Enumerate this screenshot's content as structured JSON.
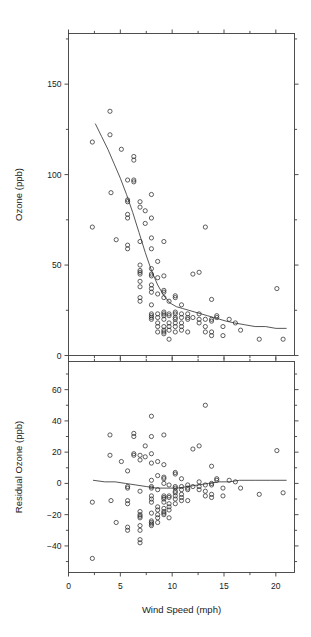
{
  "figure": {
    "background": "#ffffff",
    "point_color": "#2b2b2b",
    "line_color": "#2b2b2b",
    "axis_color": "#3c3c3c"
  },
  "chart_data": [
    {
      "id": "ozone-vs-wind",
      "type": "scatter",
      "title": "",
      "xlabel": "",
      "ylabel": "Ozone (ppb)",
      "xlim": [
        0,
        21.8
      ],
      "ylim": [
        0,
        178
      ],
      "xticks": [
        0,
        5,
        10,
        15,
        20
      ],
      "xticklabels": [
        "0",
        "5",
        "10",
        "15",
        "20"
      ],
      "xminorticks": [
        2.5,
        7.5,
        12.5,
        17.5
      ],
      "yticks": [
        0,
        50,
        100,
        150
      ],
      "yticklabels": [
        "0",
        "50",
        "100",
        "150"
      ],
      "yminorticks": [
        25,
        75,
        125,
        175
      ],
      "grid": false,
      "legend": null,
      "marker": "open-circle",
      "points": [
        [
          2.3,
          118
        ],
        [
          2.3,
          71
        ],
        [
          4.0,
          135
        ],
        [
          4.0,
          122
        ],
        [
          4.1,
          90
        ],
        [
          4.6,
          64
        ],
        [
          5.1,
          114
        ],
        [
          5.7,
          97
        ],
        [
          5.7,
          85
        ],
        [
          5.7,
          86
        ],
        [
          5.7,
          78
        ],
        [
          5.7,
          76
        ],
        [
          5.7,
          59
        ],
        [
          5.7,
          61
        ],
        [
          6.3,
          97
        ],
        [
          6.3,
          108
        ],
        [
          6.3,
          110
        ],
        [
          6.3,
          96
        ],
        [
          6.9,
          85
        ],
        [
          6.9,
          82
        ],
        [
          6.9,
          63
        ],
        [
          6.9,
          50
        ],
        [
          6.9,
          47
        ],
        [
          6.9,
          46
        ],
        [
          6.9,
          45
        ],
        [
          6.9,
          41
        ],
        [
          6.9,
          38
        ],
        [
          6.9,
          32
        ],
        [
          6.9,
          30
        ],
        [
          7.4,
          80
        ],
        [
          7.4,
          73
        ],
        [
          8.0,
          89
        ],
        [
          8.0,
          76
        ],
        [
          8.0,
          65
        ],
        [
          8.0,
          59
        ],
        [
          8.0,
          48
        ],
        [
          8.0,
          44
        ],
        [
          8.0,
          45
        ],
        [
          8.0,
          39
        ],
        [
          8.0,
          37
        ],
        [
          8.0,
          35
        ],
        [
          8.0,
          28
        ],
        [
          8.0,
          23
        ],
        [
          8.0,
          22
        ],
        [
          8.0,
          21
        ],
        [
          8.0,
          20
        ],
        [
          8.6,
          52
        ],
        [
          8.6,
          43
        ],
        [
          8.6,
          34
        ],
        [
          8.6,
          23
        ],
        [
          8.6,
          21
        ],
        [
          8.6,
          18
        ],
        [
          8.6,
          16
        ],
        [
          8.6,
          13
        ],
        [
          9.2,
          63
        ],
        [
          9.2,
          44
        ],
        [
          9.2,
          36
        ],
        [
          9.2,
          35
        ],
        [
          9.2,
          32
        ],
        [
          9.2,
          24
        ],
        [
          9.2,
          23
        ],
        [
          9.2,
          22
        ],
        [
          9.2,
          20
        ],
        [
          9.2,
          16
        ],
        [
          9.2,
          14
        ],
        [
          9.2,
          13
        ],
        [
          9.2,
          12
        ],
        [
          9.7,
          30
        ],
        [
          9.7,
          23
        ],
        [
          9.7,
          22
        ],
        [
          9.7,
          18
        ],
        [
          9.7,
          16
        ],
        [
          9.7,
          14
        ],
        [
          9.7,
          9
        ],
        [
          10.3,
          33
        ],
        [
          10.3,
          32
        ],
        [
          10.3,
          24
        ],
        [
          10.3,
          23
        ],
        [
          10.3,
          21
        ],
        [
          10.3,
          20
        ],
        [
          10.3,
          18
        ],
        [
          10.3,
          16
        ],
        [
          10.3,
          13
        ],
        [
          10.9,
          28
        ],
        [
          10.9,
          23
        ],
        [
          10.9,
          21
        ],
        [
          10.9,
          18
        ],
        [
          10.9,
          16
        ],
        [
          10.9,
          14
        ],
        [
          11.5,
          23
        ],
        [
          11.5,
          21
        ],
        [
          11.5,
          20
        ],
        [
          11.5,
          13
        ],
        [
          12.0,
          45
        ],
        [
          12.0,
          21
        ],
        [
          12.6,
          46
        ],
        [
          12.6,
          23
        ],
        [
          12.6,
          20
        ],
        [
          12.6,
          18
        ],
        [
          13.2,
          71
        ],
        [
          13.2,
          20
        ],
        [
          13.2,
          16
        ],
        [
          13.2,
          13
        ],
        [
          13.8,
          31
        ],
        [
          13.8,
          20
        ],
        [
          13.8,
          19
        ],
        [
          13.8,
          13
        ],
        [
          13.8,
          11
        ],
        [
          14.3,
          22
        ],
        [
          14.3,
          21
        ],
        [
          14.9,
          16
        ],
        [
          14.9,
          11
        ],
        [
          15.5,
          20
        ],
        [
          16.1,
          18
        ],
        [
          16.6,
          14
        ],
        [
          18.4,
          9
        ],
        [
          20.1,
          37
        ],
        [
          20.7,
          9
        ]
      ],
      "fit_curve": {
        "name": "loess-fit",
        "points": [
          [
            2.6,
            128
          ],
          [
            3.2,
            121
          ],
          [
            3.8,
            114
          ],
          [
            4.4,
            106
          ],
          [
            5.0,
            98
          ],
          [
            5.6,
            89
          ],
          [
            6.2,
            79
          ],
          [
            6.8,
            68
          ],
          [
            7.4,
            57
          ],
          [
            8.0,
            47
          ],
          [
            8.6,
            39
          ],
          [
            9.2,
            33
          ],
          [
            9.8,
            29
          ],
          [
            10.4,
            27
          ],
          [
            11.0,
            26
          ],
          [
            11.6,
            25
          ],
          [
            12.2,
            24
          ],
          [
            12.8,
            23
          ],
          [
            13.4,
            22
          ],
          [
            14.0,
            21
          ],
          [
            14.6,
            20
          ],
          [
            15.2,
            19
          ],
          [
            16.0,
            18
          ],
          [
            17.0,
            17
          ],
          [
            18.0,
            16
          ],
          [
            19.0,
            16
          ],
          [
            20.0,
            15
          ],
          [
            21.0,
            15
          ]
        ]
      }
    },
    {
      "id": "residual-ozone-vs-wind",
      "type": "scatter",
      "title": "",
      "xlabel": "Wind Speed (mph)",
      "ylabel": "Residual Ozone (ppb)",
      "xlim": [
        0,
        21.8
      ],
      "ylim": [
        -57,
        78
      ],
      "xticks": [
        0,
        5,
        10,
        15,
        20
      ],
      "xticklabels": [
        "0",
        "5",
        "10",
        "15",
        "20"
      ],
      "xminorticks": [
        2.5,
        7.5,
        12.5,
        17.5
      ],
      "yticks": [
        -40,
        -20,
        0,
        20,
        40,
        60
      ],
      "yticklabels": [
        "-40",
        "-20",
        "0",
        "20",
        "40",
        "60"
      ],
      "yminorticks": [
        -50,
        -30,
        -10,
        10,
        30,
        50,
        70
      ],
      "grid": false,
      "legend": null,
      "marker": "open-circle",
      "points": [
        [
          2.3,
          -12
        ],
        [
          2.3,
          -48
        ],
        [
          4.0,
          31
        ],
        [
          4.0,
          18
        ],
        [
          4.1,
          -11
        ],
        [
          4.6,
          -25
        ],
        [
          5.1,
          14
        ],
        [
          5.7,
          8
        ],
        [
          5.7,
          -2
        ],
        [
          5.7,
          -3
        ],
        [
          5.7,
          -11
        ],
        [
          5.7,
          -13
        ],
        [
          5.7,
          -28
        ],
        [
          5.7,
          -30
        ],
        [
          6.3,
          19
        ],
        [
          6.3,
          30
        ],
        [
          6.3,
          32
        ],
        [
          6.3,
          18
        ],
        [
          6.9,
          18
        ],
        [
          6.9,
          15
        ],
        [
          6.9,
          -5
        ],
        [
          6.9,
          -18
        ],
        [
          6.9,
          -20
        ],
        [
          6.9,
          -21
        ],
        [
          6.9,
          -22
        ],
        [
          6.9,
          -27
        ],
        [
          6.9,
          -30
        ],
        [
          6.9,
          -36
        ],
        [
          6.9,
          -38
        ],
        [
          7.4,
          24
        ],
        [
          7.4,
          17
        ],
        [
          8.0,
          43
        ],
        [
          8.0,
          30
        ],
        [
          8.0,
          19
        ],
        [
          8.0,
          13
        ],
        [
          8.0,
          2
        ],
        [
          8.0,
          -3
        ],
        [
          8.0,
          -2
        ],
        [
          8.0,
          -8
        ],
        [
          8.0,
          -10
        ],
        [
          8.0,
          -12
        ],
        [
          8.0,
          -19
        ],
        [
          8.0,
          -24
        ],
        [
          8.0,
          -25
        ],
        [
          8.0,
          -26
        ],
        [
          8.0,
          -27
        ],
        [
          8.6,
          14
        ],
        [
          8.6,
          5
        ],
        [
          8.6,
          -4
        ],
        [
          8.6,
          -15
        ],
        [
          8.6,
          -17
        ],
        [
          8.6,
          -20
        ],
        [
          8.6,
          -22
        ],
        [
          8.6,
          -25
        ],
        [
          9.2,
          31
        ],
        [
          9.2,
          12
        ],
        [
          9.2,
          4
        ],
        [
          9.2,
          3
        ],
        [
          9.2,
          0
        ],
        [
          9.2,
          -8
        ],
        [
          9.2,
          -9
        ],
        [
          9.2,
          -10
        ],
        [
          9.2,
          -12
        ],
        [
          9.2,
          -16
        ],
        [
          9.2,
          -18
        ],
        [
          9.2,
          -19
        ],
        [
          9.2,
          -20
        ],
        [
          9.7,
          -1
        ],
        [
          9.7,
          -8
        ],
        [
          9.7,
          -9
        ],
        [
          9.7,
          -13
        ],
        [
          9.7,
          -15
        ],
        [
          9.7,
          -17
        ],
        [
          9.7,
          -22
        ],
        [
          10.3,
          7
        ],
        [
          10.3,
          6
        ],
        [
          10.3,
          -2
        ],
        [
          10.3,
          -3
        ],
        [
          10.3,
          -5
        ],
        [
          10.3,
          -6
        ],
        [
          10.3,
          -8
        ],
        [
          10.3,
          -10
        ],
        [
          10.3,
          -13
        ],
        [
          10.9,
          3
        ],
        [
          10.9,
          -2
        ],
        [
          10.9,
          -4
        ],
        [
          10.9,
          -7
        ],
        [
          10.9,
          -9
        ],
        [
          10.9,
          -11
        ],
        [
          11.5,
          -1
        ],
        [
          11.5,
          -3
        ],
        [
          11.5,
          -4
        ],
        [
          11.5,
          -11
        ],
        [
          12.0,
          22
        ],
        [
          12.0,
          -2
        ],
        [
          12.6,
          24
        ],
        [
          12.6,
          1
        ],
        [
          12.6,
          -2
        ],
        [
          12.6,
          -4
        ],
        [
          13.2,
          50
        ],
        [
          13.2,
          -1
        ],
        [
          13.2,
          -5
        ],
        [
          13.2,
          -8
        ],
        [
          13.8,
          11
        ],
        [
          13.8,
          0
        ],
        [
          13.8,
          -1
        ],
        [
          13.8,
          -7
        ],
        [
          13.8,
          -9
        ],
        [
          14.3,
          3
        ],
        [
          14.3,
          2
        ],
        [
          14.9,
          -3
        ],
        [
          14.9,
          -8
        ],
        [
          15.5,
          2
        ],
        [
          16.1,
          1
        ],
        [
          16.6,
          -3
        ],
        [
          18.4,
          -7
        ],
        [
          20.1,
          21
        ],
        [
          20.7,
          -6
        ]
      ],
      "fit_curve": {
        "name": "residual-smooth",
        "points": [
          [
            2.4,
            2
          ],
          [
            3.5,
            1
          ],
          [
            4.5,
            1
          ],
          [
            5.5,
            0
          ],
          [
            6.5,
            -1
          ],
          [
            7.5,
            -2
          ],
          [
            8.5,
            -3
          ],
          [
            9.5,
            -3
          ],
          [
            10.5,
            -3
          ],
          [
            11.5,
            -2
          ],
          [
            12.5,
            -1
          ],
          [
            13.5,
            0
          ],
          [
            14.5,
            1
          ],
          [
            15.5,
            1
          ],
          [
            16.5,
            2
          ],
          [
            18.0,
            2
          ],
          [
            19.5,
            2
          ],
          [
            21.0,
            2
          ]
        ]
      }
    }
  ]
}
